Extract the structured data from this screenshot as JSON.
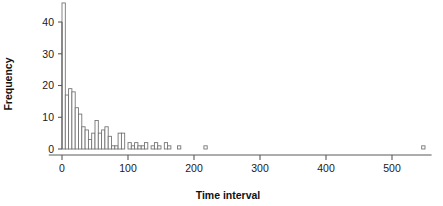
{
  "chart_data": {
    "type": "bar",
    "subtype": "histogram",
    "title": "",
    "xlabel": "Time interval",
    "ylabel": "Frequency",
    "xlim": [
      -20,
      560
    ],
    "ylim": [
      0,
      46
    ],
    "xticks": [
      0,
      100,
      200,
      300,
      400,
      500
    ],
    "xticklabels": [
      "0",
      "100",
      "200",
      "300",
      "400",
      "500"
    ],
    "yticks": [
      0,
      10,
      20,
      30,
      40
    ],
    "yticklabels": [
      "0",
      "10",
      "20",
      "30",
      "40"
    ],
    "grid": false,
    "legend": null,
    "bin_width": 5,
    "bin_starts": [
      0,
      5,
      10,
      15,
      20,
      25,
      30,
      35,
      40,
      45,
      50,
      55,
      60,
      65,
      70,
      75,
      80,
      85,
      90,
      95,
      100,
      105,
      110,
      115,
      120,
      125,
      130,
      135,
      140,
      145,
      150,
      155,
      160,
      165,
      170,
      175,
      180,
      185,
      190,
      195,
      200,
      205,
      210,
      215,
      220,
      225,
      230,
      235,
      240,
      245,
      250,
      255,
      260,
      265,
      270,
      275,
      280,
      285,
      290,
      295,
      300,
      305,
      310,
      315,
      320,
      325,
      330,
      335,
      340,
      345,
      350,
      355,
      360,
      365,
      370,
      375,
      380,
      385,
      390,
      395,
      400,
      405,
      410,
      415,
      420,
      425,
      430,
      435,
      440,
      445,
      450,
      455,
      460,
      465,
      470,
      475,
      480,
      485,
      490,
      495,
      500,
      505,
      510,
      515,
      520,
      525,
      530,
      535,
      540,
      545
    ],
    "categories": [
      "0-5",
      "5-10",
      "10-15",
      "15-20",
      "20-25",
      "25-30",
      "30-35",
      "35-40",
      "40-45",
      "45-50",
      "50-55",
      "55-60",
      "60-65",
      "65-70",
      "70-75",
      "75-80",
      "80-85",
      "85-90",
      "90-95",
      "95-100",
      "100-105",
      "105-110",
      "110-115",
      "115-120",
      "120-125",
      "125-130",
      "130-135",
      "135-140",
      "140-145",
      "145-150",
      "150-155",
      "155-160",
      "160-165",
      "165-170",
      "170-175",
      "175-180",
      "180-185",
      "185-190",
      "190-195",
      "195-200",
      "200-205",
      "205-210",
      "210-215",
      "215-220",
      "220-225",
      "225-230",
      "230-235",
      "235-240",
      "240-245",
      "245-250",
      "250-255",
      "255-260",
      "260-265",
      "265-270",
      "270-275",
      "275-280",
      "280-285",
      "285-290",
      "290-295",
      "295-300",
      "300-305",
      "305-310",
      "310-315",
      "315-320",
      "320-325",
      "325-330",
      "330-335",
      "335-340",
      "340-345",
      "345-350",
      "350-355",
      "355-360",
      "360-365",
      "365-370",
      "370-375",
      "375-380",
      "380-385",
      "385-390",
      "390-395",
      "395-400",
      "400-405",
      "405-410",
      "410-415",
      "415-420",
      "420-425",
      "425-430",
      "430-435",
      "435-440",
      "440-445",
      "445-450",
      "450-455",
      "455-460",
      "460-465",
      "465-470",
      "470-475",
      "475-480",
      "480-485",
      "485-490",
      "490-495",
      "495-500",
      "500-505",
      "505-510",
      "510-515",
      "515-520",
      "520-525",
      "525-530",
      "530-535",
      "535-540",
      "540-545",
      "545-550"
    ],
    "values": [
      46,
      17,
      19,
      18,
      13,
      11,
      7,
      6,
      3,
      5,
      9,
      5,
      6,
      7,
      4,
      1,
      1,
      5,
      5,
      0,
      2,
      1,
      2,
      1,
      1,
      2,
      0,
      1,
      2,
      1,
      0,
      2,
      1,
      0,
      0,
      1,
      0,
      0,
      0,
      0,
      0,
      0,
      0,
      1,
      0,
      0,
      0,
      0,
      0,
      0,
      0,
      0,
      0,
      0,
      0,
      0,
      0,
      0,
      0,
      0,
      0,
      0,
      0,
      0,
      0,
      0,
      0,
      0,
      0,
      0,
      0,
      0,
      0,
      0,
      0,
      0,
      0,
      0,
      0,
      0,
      0,
      0,
      0,
      0,
      0,
      0,
      0,
      0,
      0,
      0,
      0,
      0,
      0,
      0,
      0,
      0,
      0,
      0,
      0,
      0,
      0,
      0,
      0,
      0,
      0,
      0,
      0,
      0,
      0,
      1
    ],
    "series": [
      {
        "name": "Time interval frequency",
        "values": [
          46,
          17,
          19,
          18,
          13,
          11,
          7,
          6,
          3,
          5,
          9,
          5,
          6,
          7,
          4,
          1,
          1,
          5,
          5,
          0,
          2,
          1,
          2,
          1,
          1,
          2,
          0,
          1,
          2,
          1,
          0,
          2,
          1,
          0,
          0,
          1,
          0,
          0,
          0,
          0,
          0,
          0,
          0,
          1,
          0,
          0,
          0,
          0,
          0,
          0,
          0,
          0,
          0,
          0,
          0,
          0,
          0,
          0,
          0,
          0,
          0,
          0,
          0,
          0,
          0,
          0,
          0,
          0,
          0,
          0,
          0,
          0,
          0,
          0,
          0,
          0,
          0,
          0,
          0,
          0,
          0,
          0,
          0,
          0,
          0,
          0,
          0,
          0,
          0,
          0,
          0,
          0,
          0,
          0,
          0,
          0,
          0,
          0,
          0,
          0,
          0,
          0,
          0,
          0,
          0,
          0,
          0,
          0,
          0,
          1
        ]
      }
    ],
    "annotations": []
  }
}
